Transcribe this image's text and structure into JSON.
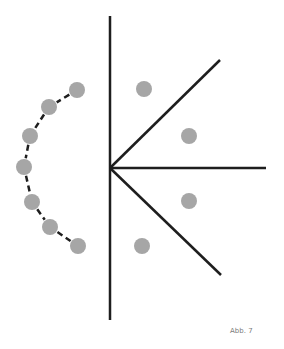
{
  "caption": "Abb. 7",
  "colors": {
    "line": "#1e1e1e",
    "dot": "#a6a6a6",
    "background": "#ffffff"
  },
  "axis": {
    "x": 110,
    "y1": 16,
    "y2": 320
  },
  "vertex": {
    "x": 110,
    "y": 168
  },
  "rays": [
    {
      "x2": 220,
      "y2": 60
    },
    {
      "x2": 266,
      "y2": 168
    },
    {
      "x2": 221,
      "y2": 275
    }
  ],
  "right_dots": [
    {
      "cx": 144,
      "cy": 89
    },
    {
      "cx": 189,
      "cy": 136
    },
    {
      "cx": 189,
      "cy": 201
    },
    {
      "cx": 142,
      "cy": 246
    }
  ],
  "arc_dots": [
    {
      "cx": 77,
      "cy": 90
    },
    {
      "cx": 49,
      "cy": 107
    },
    {
      "cx": 30,
      "cy": 136
    },
    {
      "cx": 24,
      "cy": 167
    },
    {
      "cx": 32,
      "cy": 202
    },
    {
      "cx": 50,
      "cy": 227
    },
    {
      "cx": 78,
      "cy": 246
    }
  ],
  "dot_radius": 8
}
